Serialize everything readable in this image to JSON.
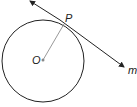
{
  "diagram": {
    "circle": {
      "cx": 43,
      "cy": 61,
      "r": 41,
      "label": "O"
    },
    "tangent_point": {
      "x": 64,
      "y": 25,
      "label": "P"
    },
    "tangent_line": {
      "label": "m",
      "x1": 29,
      "y1": 0,
      "x2": 125,
      "y2": 68
    },
    "colors": {
      "stroke": "#222222",
      "radius": "#999999"
    }
  }
}
